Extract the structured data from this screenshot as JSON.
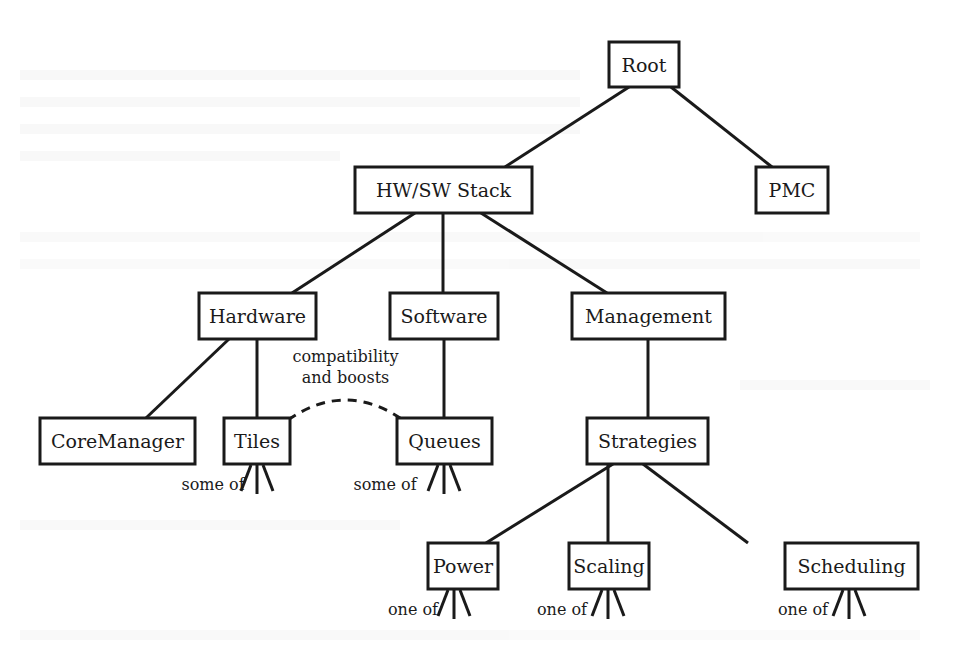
{
  "diagram": {
    "type": "tree",
    "nodes": [
      {
        "id": "root",
        "label": "Root",
        "x": 609,
        "y": 42,
        "w": 70,
        "h": 45
      },
      {
        "id": "hwsw",
        "label": "HW/SW Stack",
        "x": 355,
        "y": 167,
        "w": 177,
        "h": 46
      },
      {
        "id": "pmc",
        "label": "PMC",
        "x": 756,
        "y": 167,
        "w": 72,
        "h": 46
      },
      {
        "id": "hardware",
        "label": "Hardware",
        "x": 199,
        "y": 293,
        "w": 117,
        "h": 46
      },
      {
        "id": "software",
        "label": "Software",
        "x": 390,
        "y": 293,
        "w": 108,
        "h": 46
      },
      {
        "id": "management",
        "label": "Management",
        "x": 572,
        "y": 293,
        "w": 153,
        "h": 46
      },
      {
        "id": "coremanager",
        "label": "CoreManager",
        "x": 40,
        "y": 418,
        "w": 155,
        "h": 46
      },
      {
        "id": "tiles",
        "label": "Tiles",
        "x": 224,
        "y": 418,
        "w": 66,
        "h": 46
      },
      {
        "id": "queues",
        "label": "Queues",
        "x": 397,
        "y": 418,
        "w": 95,
        "h": 46
      },
      {
        "id": "strategies",
        "label": "Strategies",
        "x": 587,
        "y": 418,
        "w": 121,
        "h": 46
      },
      {
        "id": "power",
        "label": "Power",
        "x": 428,
        "y": 543,
        "w": 70,
        "h": 46
      },
      {
        "id": "scaling",
        "label": "Scaling",
        "x": 569,
        "y": 543,
        "w": 80,
        "h": 46
      },
      {
        "id": "scheduling",
        "label": "Scheduling",
        "x": 785,
        "y": 543,
        "w": 133,
        "h": 46
      }
    ],
    "edges": [
      {
        "from": "root",
        "to": "hwsw",
        "x1": 629,
        "y1": 87,
        "x2": 505,
        "y2": 167
      },
      {
        "from": "root",
        "to": "pmc",
        "x1": 671,
        "y1": 87,
        "x2": 772,
        "y2": 167
      },
      {
        "from": "hwsw",
        "to": "hardware",
        "x1": 415,
        "y1": 213,
        "x2": 292,
        "y2": 293
      },
      {
        "from": "hwsw",
        "to": "software",
        "x1": 443,
        "y1": 213,
        "x2": 443,
        "y2": 293
      },
      {
        "from": "hwsw",
        "to": "management",
        "x1": 481,
        "y1": 213,
        "x2": 607,
        "y2": 293
      },
      {
        "from": "hardware",
        "to": "coremanager",
        "x1": 229,
        "y1": 339,
        "x2": 146,
        "y2": 418
      },
      {
        "from": "hardware",
        "to": "tiles",
        "x1": 257,
        "y1": 339,
        "x2": 257,
        "y2": 418
      },
      {
        "from": "software",
        "to": "queues",
        "x1": 444,
        "y1": 339,
        "x2": 444,
        "y2": 418
      },
      {
        "from": "management",
        "to": "strategies",
        "x1": 648,
        "y1": 339,
        "x2": 648,
        "y2": 418
      },
      {
        "from": "strategies",
        "to": "power",
        "x1": 613,
        "y1": 464,
        "x2": 486,
        "y2": 543
      },
      {
        "from": "strategies",
        "to": "scaling",
        "x1": 608,
        "y1": 464,
        "x2": 608,
        "y2": 543
      },
      {
        "from": "strategies",
        "to": "scheduling",
        "x1": 643,
        "y1": 464,
        "x2": 748,
        "y2": 543
      }
    ],
    "relation": {
      "from": "tiles",
      "to": "queues",
      "label_line1": "compatibility",
      "label_line2": "and boosts",
      "style": "dashed"
    },
    "forks": [
      {
        "node": "tiles",
        "label": "some of",
        "cx": 257,
        "y": 465,
        "label_x": 213,
        "label_y": 490
      },
      {
        "node": "queues",
        "label": "some of",
        "cx": 444,
        "y": 465,
        "label_x": 385,
        "label_y": 490
      },
      {
        "node": "power",
        "label": "one of",
        "cx": 454,
        "y": 590,
        "label_x": 413,
        "label_y": 615
      },
      {
        "node": "scaling",
        "label": "one of",
        "cx": 608,
        "y": 590,
        "label_x": 562,
        "label_y": 615
      },
      {
        "node": "scheduling",
        "label": "one of",
        "cx": 849,
        "y": 590,
        "label_x": 803,
        "label_y": 615
      }
    ]
  }
}
